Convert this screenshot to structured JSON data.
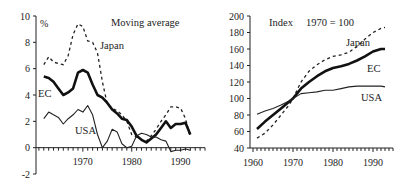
{
  "chart_data": [
    {
      "type": "line",
      "title": "Moving average",
      "ylabel": "%",
      "xlabel": "",
      "ylim": [
        -2,
        10
      ],
      "yticks": [
        "-2",
        "0",
        "2",
        "4",
        "6",
        "8",
        "10"
      ],
      "xticks": [
        "1970",
        "1980",
        "1990"
      ],
      "xlim": [
        1960,
        1995
      ],
      "grid": false,
      "legend": "inline labels",
      "series": [
        {
          "name": "Japan",
          "style": "dashed",
          "x": [
            1962,
            1963,
            1964,
            1965,
            1966,
            1967,
            1968,
            1969,
            1970,
            1971,
            1972,
            1973,
            1974,
            1975,
            1976,
            1977,
            1978,
            1979,
            1980,
            1981,
            1982,
            1983,
            1984,
            1985,
            1986,
            1987,
            1988,
            1989,
            1990,
            1991,
            1992
          ],
          "values": [
            6.3,
            6.9,
            6.5,
            6.4,
            6.3,
            7.0,
            8.6,
            9.4,
            9.2,
            8.1,
            8.0,
            7.2,
            5.0,
            3.3,
            3.0,
            2.8,
            2.5,
            2.0,
            1.0,
            0.8,
            0.6,
            0.5,
            0.9,
            1.4,
            2.0,
            2.5,
            3.1,
            3.1,
            3.0,
            2.2,
            0.8
          ]
        },
        {
          "name": "EC",
          "style": "thick",
          "x": [
            1962,
            1963,
            1964,
            1965,
            1966,
            1967,
            1968,
            1969,
            1970,
            1971,
            1972,
            1973,
            1974,
            1975,
            1976,
            1977,
            1978,
            1979,
            1980,
            1981,
            1982,
            1983,
            1984,
            1985,
            1986,
            1987,
            1988,
            1989,
            1990,
            1991,
            1992
          ],
          "values": [
            5.4,
            5.3,
            5.0,
            4.5,
            4.0,
            4.2,
            4.5,
            5.7,
            5.9,
            5.7,
            4.8,
            4.0,
            3.8,
            3.4,
            2.9,
            2.6,
            2.2,
            2.1,
            1.6,
            0.9,
            0.6,
            0.4,
            0.7,
            1.0,
            1.5,
            2.0,
            1.5,
            1.8,
            1.8,
            1.9,
            1.0
          ]
        },
        {
          "name": "USA",
          "style": "thin",
          "x": [
            1962,
            1963,
            1964,
            1965,
            1966,
            1967,
            1968,
            1969,
            1970,
            1971,
            1972,
            1973,
            1974,
            1975,
            1976,
            1977,
            1978,
            1979,
            1980,
            1981,
            1982,
            1983,
            1984,
            1985,
            1986,
            1987,
            1988,
            1989,
            1990,
            1991,
            1992
          ],
          "values": [
            2.2,
            2.7,
            2.5,
            2.3,
            1.8,
            2.2,
            2.5,
            2.9,
            2.7,
            3.2,
            2.5,
            1.0,
            0.0,
            0.5,
            1.4,
            1.2,
            0.3,
            0.0,
            0.1,
            0.9,
            1.1,
            1.0,
            0.8,
            0.8,
            0.6,
            0.5,
            -0.3,
            -0.2,
            -0.2,
            -0.1,
            -0.2
          ]
        }
      ]
    },
    {
      "type": "line",
      "title": "Index      1970 = 100",
      "ylabel": "",
      "xlabel": "",
      "ylim": [
        40,
        200
      ],
      "yticks": [
        "40",
        "60",
        "80",
        "100",
        "120",
        "140",
        "160",
        "180",
        "200"
      ],
      "xticks": [
        "1960",
        "1970",
        "1980",
        "1990"
      ],
      "xlim": [
        1960,
        1995
      ],
      "grid": false,
      "legend": "inline labels",
      "series": [
        {
          "name": "Japan",
          "style": "dashed",
          "x": [
            1961,
            1963,
            1965,
            1967,
            1969,
            1970,
            1972,
            1974,
            1976,
            1978,
            1980,
            1982,
            1984,
            1986,
            1988,
            1990,
            1992,
            1993
          ],
          "values": [
            52,
            58,
            68,
            80,
            92,
            100,
            120,
            133,
            141,
            147,
            151,
            153,
            156,
            163,
            172,
            180,
            185,
            186
          ]
        },
        {
          "name": "EC",
          "style": "thick",
          "x": [
            1961,
            1963,
            1965,
            1967,
            1969,
            1970,
            1972,
            1974,
            1976,
            1978,
            1980,
            1982,
            1984,
            1986,
            1988,
            1990,
            1992,
            1993
          ],
          "values": [
            63,
            72,
            80,
            88,
            96,
            100,
            112,
            120,
            127,
            133,
            137,
            139,
            142,
            146,
            151,
            157,
            160,
            160
          ]
        },
        {
          "name": "USA",
          "style": "thin",
          "x": [
            1961,
            1963,
            1965,
            1967,
            1969,
            1970,
            1972,
            1974,
            1976,
            1978,
            1980,
            1982,
            1984,
            1986,
            1988,
            1990,
            1992,
            1993
          ],
          "values": [
            81,
            85,
            88,
            92,
            97,
            100,
            106,
            107,
            108,
            110,
            110,
            112,
            114,
            115,
            115,
            115,
            115,
            114
          ]
        }
      ]
    }
  ],
  "labels": {
    "left_title": "Moving average",
    "left_unit": "%",
    "left_japan": "Japan",
    "left_ec": "EC",
    "left_usa": "USA",
    "right_title_a": "Index",
    "right_title_b": "1970 = 100",
    "right_japan": "Japan",
    "right_ec": "EC",
    "right_usa": "USA"
  }
}
